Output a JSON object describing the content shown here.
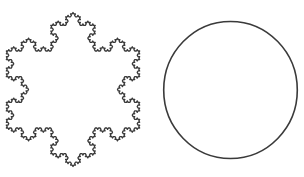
{
  "figure": {
    "background": "#ffffff",
    "stroke_color": "#3a3a3a",
    "shapes": [
      {
        "type": "koch-snowflake",
        "center": [
          73,
          89.5
        ],
        "circumradius": 77,
        "iterations": 4,
        "orientation": "vertex-up",
        "stroke_width": 1.3
      },
      {
        "type": "circle",
        "center": [
          230.5,
          90
        ],
        "rx": 66.8,
        "ry": 68.5,
        "stroke_width": 1.6
      }
    ]
  }
}
